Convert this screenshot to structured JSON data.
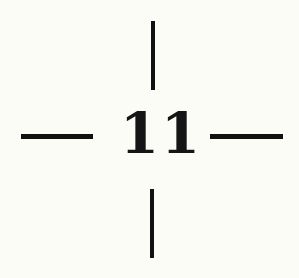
{
  "label": {
    "text": "11"
  },
  "colors": {
    "background": "#fcfcf6",
    "ink": "#111111"
  },
  "marks": {
    "type": "crosshair",
    "lines": [
      "top",
      "bottom",
      "left",
      "right"
    ]
  }
}
